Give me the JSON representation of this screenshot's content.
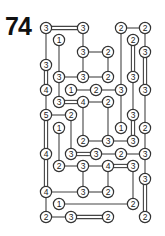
{
  "puzzle": {
    "number": "74",
    "type": "hashi-bridges",
    "grid": {
      "cols": 9,
      "rows": 16,
      "col_x": [
        46,
        59,
        71,
        83,
        96,
        108,
        121,
        133,
        145
      ],
      "row_y": [
        28,
        40,
        52,
        65,
        77,
        90,
        102,
        115,
        128,
        141,
        154,
        166,
        179,
        192,
        204,
        217
      ]
    },
    "nodes": [
      {
        "r": 0,
        "c": 0,
        "v": "3"
      },
      {
        "r": 0,
        "c": 3,
        "v": "3"
      },
      {
        "r": 0,
        "c": 6,
        "v": "2"
      },
      {
        "r": 0,
        "c": 8,
        "v": "2"
      },
      {
        "r": 1,
        "c": 1,
        "v": "1"
      },
      {
        "r": 1,
        "c": 7,
        "v": "2"
      },
      {
        "r": 2,
        "c": 3,
        "v": "3"
      },
      {
        "r": 2,
        "c": 5,
        "v": "2"
      },
      {
        "r": 2,
        "c": 8,
        "v": "3"
      },
      {
        "r": 3,
        "c": 0,
        "v": "3"
      },
      {
        "r": 4,
        "c": 1,
        "v": "3"
      },
      {
        "r": 4,
        "c": 3,
        "v": "3"
      },
      {
        "r": 4,
        "c": 5,
        "v": "2"
      },
      {
        "r": 4,
        "c": 7,
        "v": "3"
      },
      {
        "r": 5,
        "c": 0,
        "v": "4"
      },
      {
        "r": 5,
        "c": 2,
        "v": "1"
      },
      {
        "r": 5,
        "c": 4,
        "v": "2"
      },
      {
        "r": 5,
        "c": 6,
        "v": "3"
      },
      {
        "r": 5,
        "c": 8,
        "v": "3"
      },
      {
        "r": 6,
        "c": 1,
        "v": "3"
      },
      {
        "r": 6,
        "c": 3,
        "v": "4"
      },
      {
        "r": 6,
        "c": 5,
        "v": "2"
      },
      {
        "r": 7,
        "c": 0,
        "v": "5"
      },
      {
        "r": 7,
        "c": 2,
        "v": "2"
      },
      {
        "r": 7,
        "c": 7,
        "v": "3"
      },
      {
        "r": 8,
        "c": 1,
        "v": "1"
      },
      {
        "r": 8,
        "c": 6,
        "v": "1"
      },
      {
        "r": 8,
        "c": 8,
        "v": "2"
      },
      {
        "r": 9,
        "c": 3,
        "v": "2"
      },
      {
        "r": 9,
        "c": 5,
        "v": "3"
      },
      {
        "r": 9,
        "c": 7,
        "v": "3"
      },
      {
        "r": 10,
        "c": 0,
        "v": "4"
      },
      {
        "r": 10,
        "c": 2,
        "v": "3"
      },
      {
        "r": 10,
        "c": 4,
        "v": "3"
      },
      {
        "r": 10,
        "c": 6,
        "v": "2"
      },
      {
        "r": 10,
        "c": 8,
        "v": "3"
      },
      {
        "r": 11,
        "c": 1,
        "v": "2"
      },
      {
        "r": 11,
        "c": 3,
        "v": "3"
      },
      {
        "r": 11,
        "c": 5,
        "v": "4"
      },
      {
        "r": 11,
        "c": 7,
        "v": "3"
      },
      {
        "r": 12,
        "c": 8,
        "v": "3"
      },
      {
        "r": 13,
        "c": 0,
        "v": "4"
      },
      {
        "r": 13,
        "c": 3,
        "v": "3"
      },
      {
        "r": 13,
        "c": 5,
        "v": "2"
      },
      {
        "r": 14,
        "c": 1,
        "v": "1"
      },
      {
        "r": 14,
        "c": 7,
        "v": "2"
      },
      {
        "r": 15,
        "c": 0,
        "v": "2"
      },
      {
        "r": 15,
        "c": 2,
        "v": "3"
      },
      {
        "r": 15,
        "c": 5,
        "v": "2"
      },
      {
        "r": 15,
        "c": 8,
        "v": "2"
      }
    ],
    "bridges": [
      {
        "from": [
          0,
          0
        ],
        "to": [
          0,
          3
        ],
        "n": 2
      },
      {
        "from": [
          0,
          6
        ],
        "to": [
          0,
          8
        ],
        "n": 1
      },
      {
        "from": [
          0,
          0
        ],
        "to": [
          3,
          0
        ],
        "n": 1
      },
      {
        "from": [
          3,
          0
        ],
        "to": [
          5,
          0
        ],
        "n": 2
      },
      {
        "from": [
          5,
          0
        ],
        "to": [
          7,
          0
        ],
        "n": 1
      },
      {
        "from": [
          7,
          0
        ],
        "to": [
          10,
          0
        ],
        "n": 2
      },
      {
        "from": [
          10,
          0
        ],
        "to": [
          13,
          0
        ],
        "n": 2
      },
      {
        "from": [
          13,
          0
        ],
        "to": [
          15,
          0
        ],
        "n": 1
      },
      {
        "from": [
          1,
          1
        ],
        "to": [
          4,
          1
        ],
        "n": 1
      },
      {
        "from": [
          4,
          1
        ],
        "to": [
          6,
          1
        ],
        "n": 1
      },
      {
        "from": [
          0,
          3
        ],
        "to": [
          2,
          3
        ],
        "n": 1
      },
      {
        "from": [
          2,
          3
        ],
        "to": [
          4,
          3
        ],
        "n": 1
      },
      {
        "from": [
          2,
          3
        ],
        "to": [
          2,
          5
        ],
        "n": 1
      },
      {
        "from": [
          2,
          5
        ],
        "to": [
          4,
          5
        ],
        "n": 1
      },
      {
        "from": [
          4,
          1
        ],
        "to": [
          4,
          3
        ],
        "n": 1
      },
      {
        "from": [
          4,
          3
        ],
        "to": [
          4,
          5
        ],
        "n": 1
      },
      {
        "from": [
          0,
          6
        ],
        "to": [
          5,
          6
        ],
        "n": 1
      },
      {
        "from": [
          1,
          7
        ],
        "to": [
          4,
          7
        ],
        "n": 2
      },
      {
        "from": [
          0,
          8
        ],
        "to": [
          2,
          8
        ],
        "n": 1
      },
      {
        "from": [
          2,
          8
        ],
        "to": [
          5,
          8
        ],
        "n": 2
      },
      {
        "from": [
          5,
          2
        ],
        "to": [
          5,
          4
        ],
        "n": 1
      },
      {
        "from": [
          5,
          4
        ],
        "to": [
          5,
          6
        ],
        "n": 1
      },
      {
        "from": [
          6,
          1
        ],
        "to": [
          6,
          3
        ],
        "n": 2
      },
      {
        "from": [
          6,
          3
        ],
        "to": [
          6,
          5
        ],
        "n": 1
      },
      {
        "from": [
          7,
          0
        ],
        "to": [
          7,
          2
        ],
        "n": 1
      },
      {
        "from": [
          7,
          2
        ],
        "to": [
          10,
          2
        ],
        "n": 1
      },
      {
        "from": [
          6,
          3
        ],
        "to": [
          9,
          3
        ],
        "n": 1
      },
      {
        "from": [
          6,
          5
        ],
        "to": [
          9,
          5
        ],
        "n": 1
      },
      {
        "from": [
          5,
          6
        ],
        "to": [
          8,
          6
        ],
        "n": 1
      },
      {
        "from": [
          4,
          7
        ],
        "to": [
          7,
          7
        ],
        "n": 1
      },
      {
        "from": [
          7,
          7
        ],
        "to": [
          9,
          7
        ],
        "n": 2
      },
      {
        "from": [
          5,
          8
        ],
        "to": [
          8,
          8
        ],
        "n": 1
      },
      {
        "from": [
          8,
          8
        ],
        "to": [
          10,
          8
        ],
        "n": 1
      },
      {
        "from": [
          10,
          8
        ],
        "to": [
          12,
          8
        ],
        "n": 1
      },
      {
        "from": [
          12,
          8
        ],
        "to": [
          15,
          8
        ],
        "n": 2
      },
      {
        "from": [
          9,
          3
        ],
        "to": [
          9,
          5
        ],
        "n": 1
      },
      {
        "from": [
          9,
          5
        ],
        "to": [
          9,
          7
        ],
        "n": 1
      },
      {
        "from": [
          10,
          2
        ],
        "to": [
          10,
          4
        ],
        "n": 2
      },
      {
        "from": [
          10,
          4
        ],
        "to": [
          10,
          6
        ],
        "n": 1
      },
      {
        "from": [
          10,
          6
        ],
        "to": [
          10,
          8
        ],
        "n": 1
      },
      {
        "from": [
          8,
          1
        ],
        "to": [
          11,
          1
        ],
        "n": 1
      },
      {
        "from": [
          11,
          1
        ],
        "to": [
          11,
          3
        ],
        "n": 1
      },
      {
        "from": [
          11,
          3
        ],
        "to": [
          11,
          5
        ],
        "n": 1
      },
      {
        "from": [
          11,
          5
        ],
        "to": [
          11,
          7
        ],
        "n": 2
      },
      {
        "from": [
          11,
          3
        ],
        "to": [
          13,
          3
        ],
        "n": 1
      },
      {
        "from": [
          11,
          5
        ],
        "to": [
          13,
          5
        ],
        "n": 1
      },
      {
        "from": [
          11,
          7
        ],
        "to": [
          14,
          7
        ],
        "n": 1
      },
      {
        "from": [
          13,
          0
        ],
        "to": [
          13,
          3
        ],
        "n": 1
      },
      {
        "from": [
          13,
          3
        ],
        "to": [
          13,
          5
        ],
        "n": 1
      },
      {
        "from": [
          14,
          1
        ],
        "to": [
          14,
          7
        ],
        "n": 1
      },
      {
        "from": [
          15,
          0
        ],
        "to": [
          15,
          2
        ],
        "n": 1
      },
      {
        "from": [
          15,
          2
        ],
        "to": [
          15,
          5
        ],
        "n": 2
      }
    ]
  }
}
